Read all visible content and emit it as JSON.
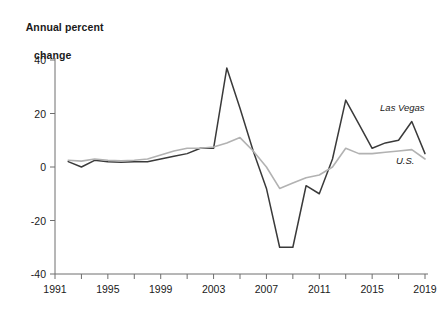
{
  "chart_data": {
    "type": "line",
    "title": "Annual percent change",
    "title_line1": "Annual percent",
    "title_line2": "change",
    "xlabel": "",
    "ylabel": "Annual percent change",
    "xlim": [
      1991,
      2019
    ],
    "ylim": [
      -40,
      40
    ],
    "grid": false,
    "legend_position": "inline-right",
    "ytick_labels": [
      "40",
      "20",
      "0",
      "-20",
      "-40"
    ],
    "ytick_values": [
      40,
      20,
      0,
      -20,
      -40
    ],
    "xtick_labels": [
      "1991",
      "1995",
      "1999",
      "2003",
      "2007",
      "2011",
      "2015",
      "2019"
    ],
    "xtick_values": [
      1991,
      1995,
      1999,
      2003,
      2007,
      2011,
      2015,
      2019
    ],
    "xminor_step": 2,
    "x": [
      1992,
      1993,
      1994,
      1995,
      1996,
      1997,
      1998,
      1999,
      2000,
      2001,
      2002,
      2003,
      2004,
      2005,
      2006,
      2007,
      2008,
      2009,
      2010,
      2011,
      2012,
      2013,
      2014,
      2015,
      2016,
      2017,
      2018,
      2019
    ],
    "series": [
      {
        "name": "Las Vegas",
        "color": "#3a3a3a",
        "label_x": 2015.6,
        "label_y": 21,
        "values": [
          2,
          0,
          2.5,
          2,
          1.8,
          2,
          2,
          3,
          4,
          5,
          7,
          7,
          37,
          22,
          6,
          -8,
          -30,
          -30,
          -7,
          -10,
          3,
          25,
          16,
          7,
          9,
          10,
          17,
          5
        ]
      },
      {
        "name": "U.S.",
        "color": "#b2b2b2",
        "label_x": 2016.8,
        "label_y": 1,
        "values": [
          2.5,
          2.2,
          3,
          2.5,
          2.3,
          2.5,
          3,
          4.5,
          6,
          7,
          7,
          7.5,
          9,
          11,
          6,
          0,
          -8,
          -6,
          -4,
          -3,
          0,
          7,
          5,
          5,
          5.5,
          6,
          6.5,
          3
        ]
      }
    ]
  }
}
